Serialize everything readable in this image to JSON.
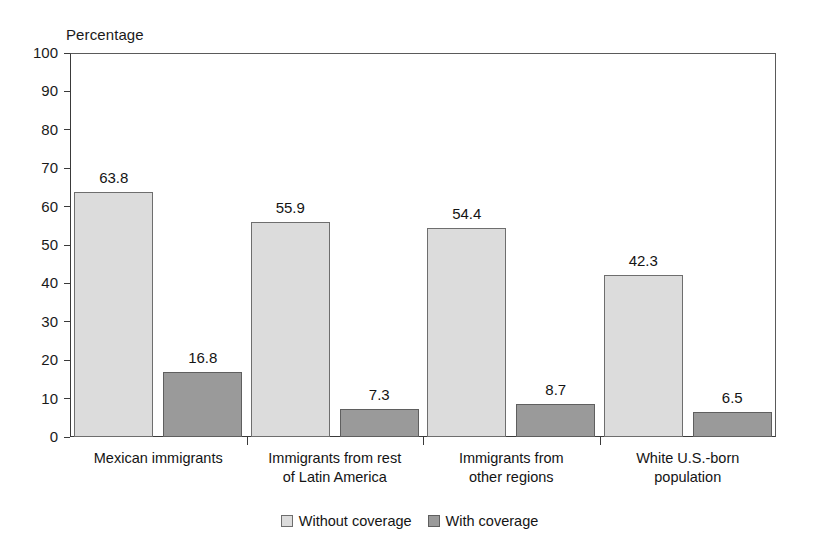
{
  "chart_data": {
    "type": "bar",
    "title": "",
    "subtitle": "",
    "xlabel": "",
    "ylabel": "Percentage",
    "ylim": [
      0,
      100
    ],
    "ytick_step": 10,
    "yticks": [
      100,
      90,
      80,
      70,
      60,
      50,
      40,
      30,
      20,
      10,
      0
    ],
    "grid": false,
    "legend_position": "bottom-center",
    "categories": [
      "Mexican immigrants",
      "Immigrants from rest\nof Latin America",
      "Immigrants from\nother regions",
      "White U.S.-born\npopulation"
    ],
    "series": [
      {
        "name": "Without coverage",
        "color": "#dcdcdc",
        "values": [
          63.8,
          55.9,
          54.4,
          42.3
        ],
        "value_labels": [
          "63.8",
          "55.9",
          "54.4",
          "42.3"
        ]
      },
      {
        "name": "With coverage",
        "color": "#9a9a9a",
        "values": [
          16.8,
          7.3,
          8.7,
          6.5
        ],
        "value_labels": [
          "16.8",
          "7.3",
          "8.7",
          "6.5"
        ]
      }
    ]
  },
  "legend": {
    "items": [
      {
        "label": "Without coverage",
        "swatch": "light"
      },
      {
        "label": "With coverage",
        "swatch": "dark"
      }
    ]
  }
}
